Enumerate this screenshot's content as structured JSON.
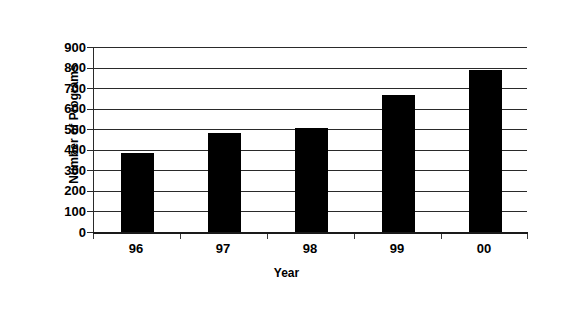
{
  "chart_data": {
    "type": "bar",
    "title": "",
    "xlabel": "Year",
    "ylabel": "Number of Programs",
    "categories": [
      "96",
      "97",
      "98",
      "99",
      "00"
    ],
    "values": [
      385,
      480,
      505,
      665,
      790
    ],
    "ylim": [
      0,
      900
    ],
    "yticks": [
      0,
      100,
      200,
      300,
      400,
      500,
      600,
      700,
      800,
      900
    ],
    "ytick_labels": [
      "0",
      "100",
      "200",
      "300",
      "400",
      "500",
      "600",
      "700",
      "800",
      "900"
    ],
    "grid": true,
    "grid_axis": "y",
    "legend": null,
    "series": [
      {
        "name": "Number of Programs",
        "color": "#000000",
        "values": [
          385,
          480,
          505,
          665,
          790
        ]
      }
    ],
    "bar_color": "#000000",
    "frame_color": "#6d6d6d",
    "background": "#ffffff"
  },
  "axis": {
    "y_title": "Number of Programs",
    "x_title": "Year",
    "tick_900": "900",
    "tick_800": "800",
    "tick_700": "700",
    "tick_600": "600",
    "tick_500": "500",
    "tick_400": "400",
    "tick_300": "300",
    "tick_200": "200",
    "tick_100": "100",
    "tick_0": "0",
    "cat_0": "96",
    "cat_1": "97",
    "cat_2": "98",
    "cat_3": "99",
    "cat_4": "00"
  }
}
